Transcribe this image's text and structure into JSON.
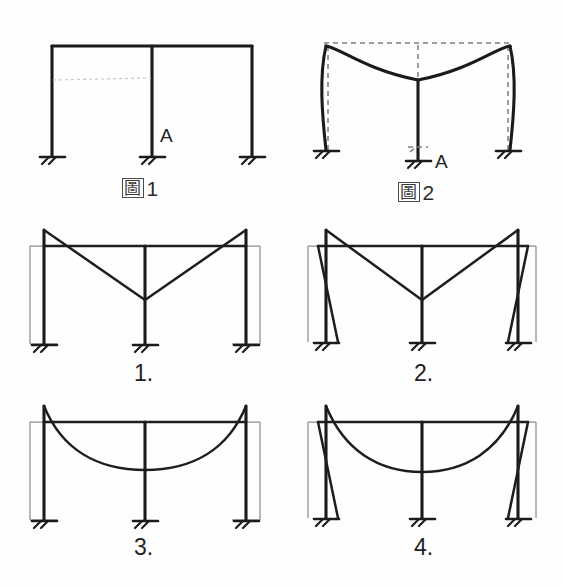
{
  "document": {
    "kind": "engineering-diagram",
    "subject": "two-bay portal frame deflected shape",
    "background_color": "#fefefe",
    "ink_color": "#1b1b1b",
    "reference_line_color": "#8e8e8e"
  },
  "figures": [
    {
      "id": "figure-1",
      "caption_cjk": "圖",
      "caption_number": "1",
      "description": "undeformed two-bay rigid frame with three supports",
      "node_label": "A",
      "support_count": 3
    },
    {
      "id": "figure-2",
      "caption_cjk": "圖",
      "caption_number": "2",
      "description": "deformed frame: beam sags, outer columns bow outward, centre column settles",
      "node_label": "A",
      "support_count": 3,
      "has_dashed_original": true
    }
  ],
  "options": [
    {
      "id": "option-1",
      "label": "1.",
      "beam_shape": "V-shaped straight chords",
      "columns": "straight, tilted inward at top",
      "shows_reference_frame": true
    },
    {
      "id": "option-2",
      "label": "2.",
      "beam_shape": "V-shaped straight chords",
      "columns": "outer columns bowed inward",
      "shows_reference_frame": true
    },
    {
      "id": "option-3",
      "label": "3.",
      "beam_shape": "smooth continuous sagging curve",
      "columns": "straight, tilted inward at top",
      "shows_reference_frame": true
    },
    {
      "id": "option-4",
      "label": "4.",
      "beam_shape": "smooth continuous sagging curve",
      "columns": "outer columns bowed inward",
      "shows_reference_frame": true
    }
  ],
  "annotations": {
    "point_a": "A"
  }
}
